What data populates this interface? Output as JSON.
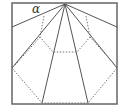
{
  "diagram": {
    "angle_label": "α",
    "colors": {
      "stroke": "#555555",
      "background": "#ffffff"
    }
  }
}
